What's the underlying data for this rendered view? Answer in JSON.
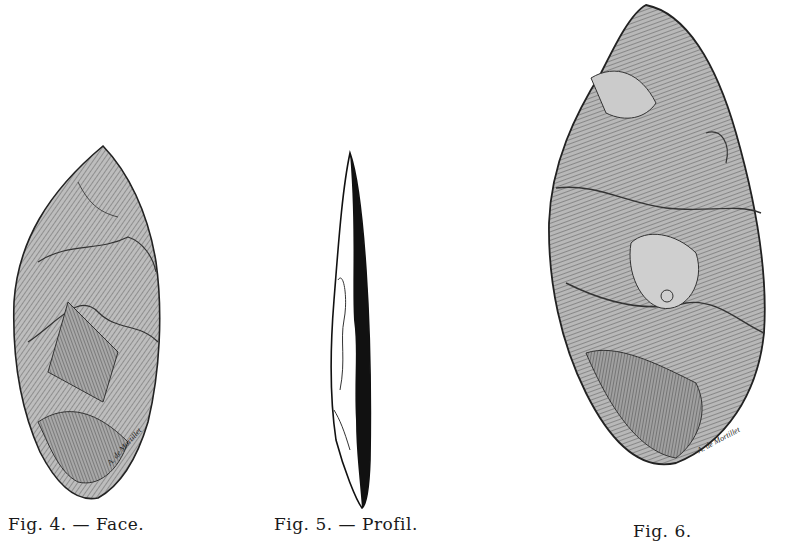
{
  "figures": [
    {
      "id": "fig4",
      "caption": "Fig. 4. — Face.",
      "subject": "flint biface, face view",
      "signature": "A. de Mortillet"
    },
    {
      "id": "fig5",
      "caption": "Fig. 5. — Profil.",
      "subject": "flint biface, profile view"
    },
    {
      "id": "fig6",
      "caption": "Fig. 6.",
      "subject": "flint biface, large almond-shaped",
      "signature": "A. de Mortillet"
    }
  ],
  "colors": {
    "background": "#ffffff",
    "ink": "#1a1a1a",
    "stone_light": "#cfcfcf",
    "stone_mid": "#9a9a9a",
    "stone_dark": "#5a5a5a"
  }
}
